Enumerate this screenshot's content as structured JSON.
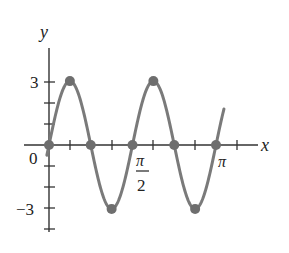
{
  "chart_data": {
    "type": "line",
    "title": "",
    "function": "y = 3 sin 4x",
    "xlabel": "x",
    "ylabel": "y",
    "xlim": [
      -0.05,
      1.05
    ],
    "ylim": [
      -4.5,
      4.5
    ],
    "x_ticks": [
      "0",
      "π/2",
      "π"
    ],
    "y_ticks": [
      "3",
      "-3"
    ],
    "marked_points": [
      {
        "x": "0",
        "y": 0
      },
      {
        "x": "π/8",
        "y": 3
      },
      {
        "x": "π/4",
        "y": 0
      },
      {
        "x": "3π/8",
        "y": -3
      },
      {
        "x": "π/2",
        "y": 0
      },
      {
        "x": "5π/8",
        "y": 3
      },
      {
        "x": "3π/4",
        "y": 0
      },
      {
        "x": "7π/8",
        "y": -3
      },
      {
        "x": "π",
        "y": 0
      }
    ],
    "grid": false,
    "colors": {
      "curve": "#7a7a7a",
      "points": "#6e6e6e",
      "axes": "#333333"
    }
  },
  "labels": {
    "x_axis": "x",
    "y_axis": "y",
    "origin": "0",
    "y_pos": "3",
    "y_neg": "−3",
    "pi_num": "π",
    "pi_den": "2",
    "pi": "π"
  }
}
